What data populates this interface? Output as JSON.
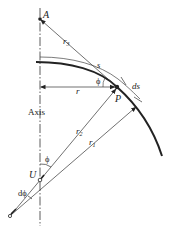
{
  "diagram": {
    "type": "shell-of-revolution-geometry",
    "labels": {
      "A": "A",
      "r3": "r",
      "r3_sub": "3",
      "s": "s",
      "phi_top": "ϕ",
      "ds": "ds",
      "r": "r",
      "P": "P",
      "axis": "Axis",
      "r2": "r",
      "r2_sub": "2",
      "r1": "r",
      "r1_sub": "1",
      "phi_bottom": "ϕ",
      "U": "U",
      "dphi": "dϕ"
    },
    "colors": {
      "line": "#222222",
      "background": "#ffffff"
    }
  }
}
